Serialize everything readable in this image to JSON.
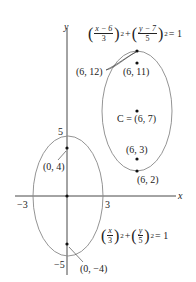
{
  "axes": {
    "x_label": "x",
    "y_label": "y"
  },
  "ellipse1": {
    "equation": {
      "x_num": "x",
      "x_den": "3",
      "y_num": "y",
      "y_den": "5",
      "exp": "2",
      "rhs": "= 1",
      "plus": "+"
    },
    "ticks": {
      "pos_y": "5",
      "neg_y": "−5",
      "pos_x": "3",
      "neg_x": "−3"
    },
    "foci": [
      "(0, 4)",
      "(0, −4)"
    ]
  },
  "ellipse2": {
    "equation": {
      "x_num": "x − 6",
      "x_den": "3",
      "y_num": "y − 7",
      "y_den": "5",
      "exp": "2",
      "rhs": "= 1",
      "plus": "+"
    },
    "center": "C = (6, 7)",
    "vertex_top": "(6, 12)",
    "vertex_bottom": "(6, 2)",
    "focus_top": "(6, 11)",
    "focus_bottom": "(6, 3)"
  }
}
